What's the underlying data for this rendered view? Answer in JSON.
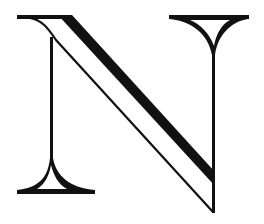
{
  "image": {
    "subject": "Decorative serif capital letter",
    "letter": "N",
    "style": "Inline / engraved display serif with hairline diagonal and flared serifs",
    "colors": {
      "ink": "#111111",
      "background": "#ffffff"
    }
  }
}
